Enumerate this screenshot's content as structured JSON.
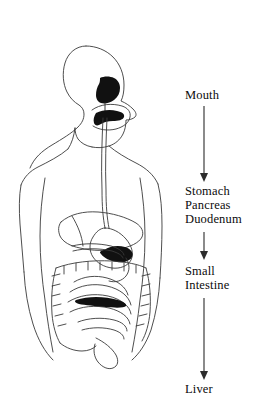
{
  "diagram": {
    "background_color": "#ffffff",
    "line_color": "#3a3a3a",
    "fill_color": "#111111",
    "text_color": "#0b0b0b",
    "flow": {
      "steps": [
        {
          "id": "mouth",
          "label": "Mouth",
          "lines": [
            "Mouth"
          ]
        },
        {
          "id": "stomach-group",
          "label": "Stomach Pancreas Duodenum",
          "lines": [
            "Stomach",
            "Pancreas",
            "Duodenum"
          ]
        },
        {
          "id": "small-intestine",
          "label": "Small Intestine",
          "lines": [
            "Small",
            "Intestine"
          ]
        },
        {
          "id": "liver",
          "label": "Liver",
          "lines": [
            "Liver"
          ]
        }
      ],
      "arrows": [
        {
          "id": "arrow-mouth-to-stomach",
          "from": "mouth",
          "to": "stomach-group"
        },
        {
          "id": "arrow-stomach-to-small-intestine",
          "from": "stomach-group",
          "to": "small-intestine"
        },
        {
          "id": "arrow-small-intestine-to-liver",
          "from": "small-intestine",
          "to": "liver"
        }
      ]
    },
    "anatomy": {
      "view": "left profile, head and torso",
      "parts": [
        "head-outline",
        "neck-outline",
        "shoulder-outline",
        "torso-outline",
        "oral-cavity",
        "tongue",
        "esophagus",
        "stomach",
        "liver",
        "pancreas",
        "duodenum",
        "small-intestine",
        "large-intestine"
      ]
    }
  }
}
